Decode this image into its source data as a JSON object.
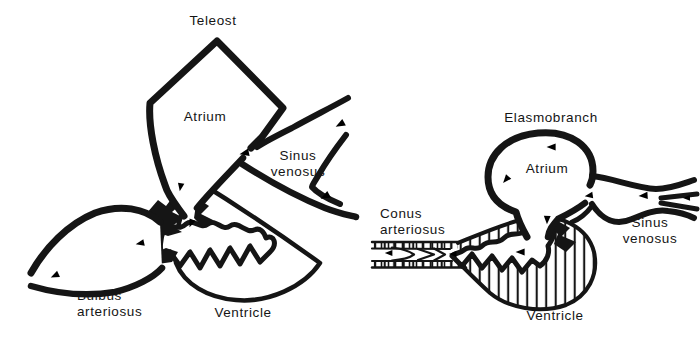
{
  "colors": {
    "background": "#ffffff",
    "ink": "#151515"
  },
  "icons": {
    "flow_arrow": "small solid triangular arrowhead showing blood-flow direction"
  },
  "panels": {
    "teleost": {
      "title": "Teleost",
      "labels": {
        "atrium": "Atrium",
        "sinus_line1": "Sinus",
        "sinus_line2": "venosus",
        "bulbus_line1": "Bulbus",
        "bulbus_line2": "arteriosus",
        "ventricle": "Ventricle"
      }
    },
    "elasmobranch": {
      "title": "Elasmobranch",
      "labels": {
        "atrium": "Atrium",
        "conus_line1": "Conus",
        "conus_line2": "arteriosus",
        "sinus_line1": "Sinus",
        "sinus_line2": "venosus",
        "ventricle": "Ventricle"
      }
    }
  }
}
